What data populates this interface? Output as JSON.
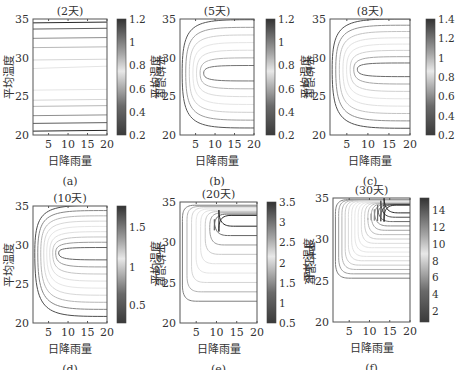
{
  "chart_data": [
    {
      "type": "contour",
      "panel_label": "(a)",
      "title": "(2天)",
      "xlabel": "日降雨量",
      "ylabel": "平均温度",
      "colorbar_label": "平均温度",
      "xlim": [
        1,
        20
      ],
      "ylim": [
        20,
        35
      ],
      "xticks": [
        5,
        10,
        15,
        20
      ],
      "yticks": [
        20,
        25,
        30,
        35
      ],
      "colorbar_range": [
        0.2,
        1.2
      ],
      "colorbar_ticks": [
        0.2,
        0.4,
        0.6,
        0.8,
        1,
        1.2
      ],
      "contour_shape": "horizontal lines",
      "peak_temperature": 28.5
    },
    {
      "type": "contour",
      "panel_label": "(b)",
      "title": "(5天)",
      "xlabel": "日降雨量",
      "ylabel": "平均温度",
      "colorbar_label": "平均温度",
      "xlim": [
        1,
        20
      ],
      "ylim": [
        20,
        35
      ],
      "xticks": [
        5,
        10,
        15,
        20
      ],
      "yticks": [
        20,
        25,
        30,
        35
      ],
      "colorbar_range": [
        0.2,
        1.2
      ],
      "colorbar_ticks": [
        0.2,
        0.4,
        0.6,
        0.8,
        1,
        1.2
      ],
      "contour_shape": "nested U opening right",
      "peak_temperature": 28
    },
    {
      "type": "contour",
      "panel_label": "(c)",
      "title": "(8天)",
      "xlabel": "日降雨量",
      "ylabel": "平均温度",
      "colorbar_label": "平均温度",
      "xlim": [
        1,
        20
      ],
      "ylim": [
        20,
        35
      ],
      "xticks": [
        5,
        10,
        15,
        20
      ],
      "yticks": [
        20,
        25,
        30,
        35
      ],
      "colorbar_range": [
        0.2,
        1.4
      ],
      "colorbar_ticks": [
        0.2,
        0.4,
        0.6,
        0.8,
        1,
        1.2,
        1.4
      ],
      "contour_shape": "nested U opening right",
      "peak_temperature": 28.5
    },
    {
      "type": "contour",
      "panel_label": "(d)",
      "title": "(10天)",
      "xlabel": "日降雨量",
      "ylabel": "平均温度",
      "colorbar_label": "平均温度",
      "xlim": [
        1,
        20
      ],
      "ylim": [
        20,
        35
      ],
      "xticks": [
        5,
        10,
        15,
        20
      ],
      "yticks": [
        20,
        25,
        30,
        35
      ],
      "colorbar_range": [
        0.2,
        1.65
      ],
      "colorbar_ticks": [
        0.5,
        1,
        1.5
      ],
      "contour_shape": "nested U opening right",
      "peak_temperature": 29
    },
    {
      "type": "contour",
      "panel_label": "(e)",
      "title": "(20天)",
      "xlabel": "日降雨量",
      "ylabel": "平均温度",
      "colorbar_label": "平均温度",
      "xlim": [
        1,
        20
      ],
      "ylim": [
        20,
        35
      ],
      "xticks": [
        5,
        10,
        15,
        20
      ],
      "yticks": [
        20,
        25,
        30,
        35
      ],
      "colorbar_range": [
        0.5,
        3.5
      ],
      "colorbar_ticks": [
        0.5,
        1,
        1.5,
        2,
        2.5,
        3,
        3.5
      ],
      "contour_shape": "nested L-shaped, peak upper right",
      "peak_temperature": 32
    },
    {
      "type": "contour",
      "panel_label": "(f)",
      "title": "(30天)",
      "xlabel": "日降雨量",
      "ylabel": "平均温度",
      "colorbar_label": "",
      "xlim": [
        1,
        20
      ],
      "ylim": [
        20,
        35
      ],
      "xticks": [
        5,
        10,
        15,
        20
      ],
      "yticks": [
        20,
        25,
        30,
        35
      ],
      "colorbar_range": [
        1,
        15.5
      ],
      "colorbar_ticks": [
        2,
        4,
        6,
        8,
        10,
        12,
        14
      ],
      "contour_shape": "nested L-shaped, peak upper right near 33-34",
      "peak_temperature": 33.5
    }
  ],
  "panels": [
    {
      "title": "(2天)",
      "label": "(a)",
      "xlabel": "日降雨量",
      "ylabel": "平均温度",
      "cblabel": "平均温度",
      "cbticks": [
        "1.2",
        "1",
        "0.8",
        "0.6",
        "0.4",
        "0.2"
      ],
      "xticks": [
        "5",
        "10",
        "15",
        "20"
      ],
      "yticks": [
        "35",
        "30",
        "25",
        "20"
      ]
    },
    {
      "title": "(5天)",
      "label": "(b)",
      "xlabel": "日降雨量",
      "ylabel": "平均温度",
      "cblabel": "平均温度",
      "cbticks": [
        "1.2",
        "1",
        "0.8",
        "0.6",
        "0.4",
        "0.2"
      ],
      "xticks": [
        "5",
        "10",
        "15",
        "20"
      ],
      "yticks": [
        "35",
        "30",
        "25",
        "20"
      ]
    },
    {
      "title": "(8天)",
      "label": "(c)",
      "xlabel": "日降雨量",
      "ylabel": "平均温度",
      "cblabel": "",
      "cbticks": [
        "1.4",
        "1.2",
        "1",
        "0.8",
        "0.6",
        "0.4",
        "0.2"
      ],
      "xticks": [
        "5",
        "10",
        "15",
        "20"
      ],
      "yticks": [
        "35",
        "30",
        "25",
        "20"
      ]
    },
    {
      "title": "(10天)",
      "label": "(d)",
      "xlabel": "日降雨量",
      "ylabel": "平均温度",
      "cblabel": "平均温度",
      "cbticks": [
        "1.5",
        "1",
        "0.5"
      ],
      "xticks": [
        "5",
        "10",
        "15",
        "20"
      ],
      "yticks": [
        "35",
        "30",
        "25",
        "20"
      ]
    },
    {
      "title": "(20天)",
      "label": "(e)",
      "xlabel": "日降雨量",
      "ylabel": "平均温度",
      "cblabel": "平均温度",
      "cbticks": [
        "3.5",
        "3",
        "2.5",
        "2",
        "1.5",
        "1",
        "0.5"
      ],
      "xticks": [
        "5",
        "10",
        "15",
        "20"
      ],
      "yticks": [
        "35",
        "30",
        "25",
        "20"
      ]
    },
    {
      "title": "(30天)",
      "label": "(f)",
      "xlabel": "日降雨量",
      "ylabel": "平均温度",
      "cblabel": "",
      "cbticks": [
        "14",
        "12",
        "10",
        "8",
        "6",
        "4",
        "2"
      ],
      "xticks": [
        "5",
        "10",
        "15",
        "20"
      ],
      "yticks": [
        "35",
        "30",
        "25",
        "20"
      ]
    }
  ]
}
